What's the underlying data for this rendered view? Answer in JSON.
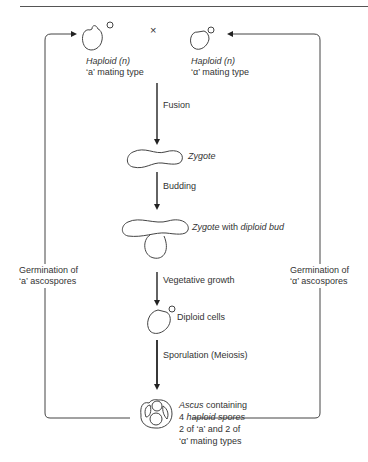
{
  "diagram": {
    "cross_symbol": "×",
    "haploid_a": {
      "line1": "Haploid (n)",
      "line2": "‘a’ mating type"
    },
    "haploid_alpha": {
      "line1": "Haploid (n)",
      "line2": "‘α’ mating type"
    },
    "steps": {
      "fusion": "Fusion",
      "zygote": "Zygote",
      "budding": "Budding",
      "zygote_bud_italic": "Zygote",
      "zygote_bud_mid": " with ",
      "zygote_bud_italic2": "diploid bud",
      "vegetative": "Vegetative growth",
      "diploid": "Diploid cells",
      "sporulation": "Sporulation  (Meiosis)"
    },
    "ascus": {
      "line1_italic": "Ascus",
      "line1_rest": " containing",
      "line2_num": "4 ",
      "line2_italic": "haploid spores",
      "line3": "2 of ‘a’ and 2 of",
      "line4": "‘α’ mating types"
    },
    "left_loop": {
      "line1": "Germination of",
      "line2": "‘a’ ascospores"
    },
    "right_loop": {
      "line1": "Germination of",
      "line2": "‘α’ ascospores"
    }
  }
}
